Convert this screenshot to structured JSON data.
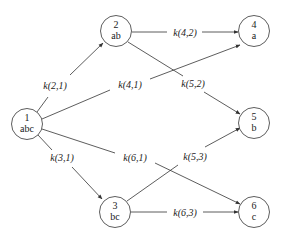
{
  "diagram": {
    "colors": {
      "stroke": "#333333",
      "text": "#222222",
      "background": "#ffffff"
    },
    "nodes": [
      {
        "id": "1",
        "number": "1",
        "label": "abc",
        "cx": 27,
        "cy": 124
      },
      {
        "id": "2",
        "number": "2",
        "label": "ab",
        "cx": 116,
        "cy": 31
      },
      {
        "id": "3",
        "number": "3",
        "label": "bc",
        "cx": 115,
        "cy": 212
      },
      {
        "id": "4",
        "number": "4",
        "label": "a",
        "cx": 254,
        "cy": 31
      },
      {
        "id": "5",
        "number": "5",
        "label": "b",
        "cx": 254,
        "cy": 123
      },
      {
        "id": "6",
        "number": "6",
        "label": "c",
        "cx": 254,
        "cy": 212
      }
    ],
    "edges": [
      {
        "from": "1",
        "to": "2",
        "label": "k(2,1)"
      },
      {
        "from": "1",
        "to": "4",
        "label": "k(4,1)"
      },
      {
        "from": "1",
        "to": "3",
        "label": "k(3,1)"
      },
      {
        "from": "1",
        "to": "6",
        "label": "k(6,1)"
      },
      {
        "from": "2",
        "to": "4",
        "label": "k(4,2)"
      },
      {
        "from": "2",
        "to": "5",
        "label": "k(5,2)"
      },
      {
        "from": "3",
        "to": "5",
        "label": "k(5,3)"
      },
      {
        "from": "3",
        "to": "6",
        "label": "k(6,3)"
      }
    ]
  }
}
